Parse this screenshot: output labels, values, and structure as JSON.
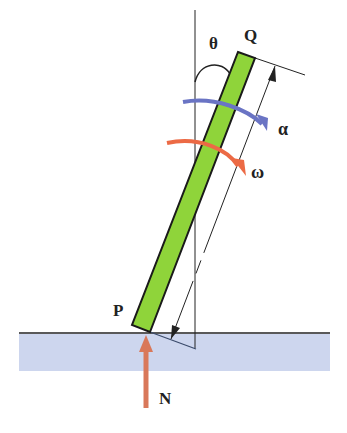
{
  "diagram": {
    "labels": {
      "theta": "θ",
      "top_end": "Q",
      "bottom_end": "P",
      "angular_acceleration": "α",
      "angular_velocity": "ω",
      "normal_force": "N"
    },
    "colors": {
      "rod_fill": "#8fd43a",
      "rod_stroke": "#1a1a1a",
      "ground_fill": "#cdd6ee",
      "alpha_arrow": "#6a74c4",
      "omega_arrow": "#ec6a45",
      "normal_arrow": "#d9785a",
      "line": "#222222"
    }
  }
}
